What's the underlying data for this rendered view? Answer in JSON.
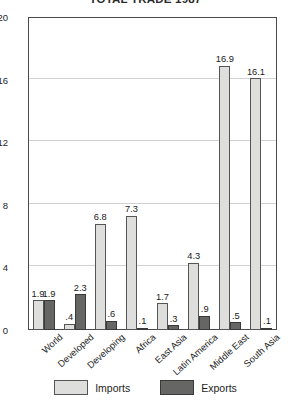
{
  "chart_data": {
    "type": "bar",
    "title": "TOTAL TRADE 1987",
    "xlabel": "",
    "ylabel": "",
    "ylim": [
      0,
      20
    ],
    "yticks": [
      0,
      4,
      8,
      12,
      16,
      20
    ],
    "grid": true,
    "legend_position": "bottom",
    "categories": [
      "World",
      "Developed",
      "Developing",
      "Africa",
      "East Asia",
      "Latin America",
      "Middle East",
      "South Asia"
    ],
    "series": [
      {
        "name": "Imports",
        "color": "#dededc",
        "values": [
          1.9,
          0.4,
          6.8,
          7.3,
          1.7,
          4.3,
          16.9,
          16.1
        ],
        "labels": [
          "1.9",
          ".4",
          "6.8",
          "7.3",
          "1.7",
          "4.3",
          "16.9",
          "16.1"
        ]
      },
      {
        "name": "Exports",
        "color": "#666664",
        "values": [
          1.9,
          2.3,
          0.6,
          0.1,
          0.3,
          0.9,
          0.5,
          0.1
        ],
        "labels": [
          "1.9",
          "2.3",
          ".6",
          ".1",
          ".3",
          ".9",
          ".5",
          ".1"
        ]
      }
    ]
  },
  "legend": {
    "items": [
      {
        "label": "Imports"
      },
      {
        "label": "Exports"
      }
    ]
  }
}
